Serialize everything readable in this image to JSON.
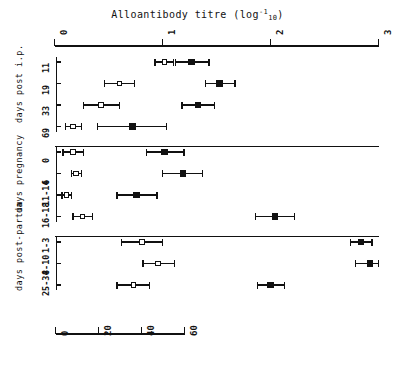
{
  "chart_data": {
    "type": "scatter",
    "title_parts": {
      "main": "Alloantibody titre (log",
      "sub": "10",
      "sup": "-1",
      "tail": ")"
    },
    "xlabel": "",
    "ylabel": "",
    "top_axis": {
      "label": "Alloantibody titre (log10^-1)",
      "ticks": [
        "0",
        "1",
        "2",
        "3"
      ],
      "values": [
        0,
        1,
        2,
        3
      ],
      "xlim": [
        0,
        3
      ],
      "position": "top"
    },
    "bottom_axis": {
      "ticks": [
        "0",
        "20",
        "40",
        "60"
      ],
      "values": [
        0,
        20,
        40,
        60
      ],
      "xlim": [
        0,
        60
      ],
      "position": "bottom"
    },
    "legend": {
      "position": "none",
      "entries": [
        {
          "name": "open-circle-series",
          "marker": "open circle"
        },
        {
          "name": "filled-square-series",
          "marker": "filled square"
        }
      ]
    },
    "grid": false,
    "groups": [
      {
        "name": "days post i.p.",
        "label_lines": [
          "days post",
          "i.p."
        ],
        "rows": [
          {
            "label": "11",
            "open": {
              "value": 1.02,
              "low": 0.93,
              "high": 1.1
            },
            "filled": {
              "value": 1.27,
              "low": 1.12,
              "high": 1.43
            }
          },
          {
            "label": "19",
            "open": {
              "value": 0.6,
              "low": 0.46,
              "high": 0.74
            },
            "filled": {
              "value": 1.53,
              "low": 1.4,
              "high": 1.67
            }
          },
          {
            "label": "33",
            "open": {
              "value": 0.43,
              "low": 0.27,
              "high": 0.6
            },
            "filled": {
              "value": 1.33,
              "low": 1.18,
              "high": 1.48
            }
          },
          {
            "label": "69",
            "open": {
              "value": 0.17,
              "low": 0.1,
              "high": 0.25
            },
            "filled": {
              "value": 0.72,
              "low": 0.4,
              "high": 1.04
            }
          }
        ]
      },
      {
        "name": "days pregnancy",
        "label_lines": [
          "days",
          "pregnancy"
        ],
        "rows": [
          {
            "label": "0",
            "open": {
              "value": 0.17,
              "low": 0.08,
              "high": 0.27
            },
            "filled": {
              "value": 1.02,
              "low": 0.85,
              "high": 1.2
            }
          },
          {
            "label": "6",
            "open": {
              "value": 0.2,
              "low": 0.16,
              "high": 0.25
            },
            "filled": {
              "value": 1.19,
              "low": 1.0,
              "high": 1.37
            }
          },
          {
            "label": "11-14",
            "open": {
              "value": 0.11,
              "low": 0.07,
              "high": 0.16
            },
            "filled": {
              "value": 0.76,
              "low": 0.58,
              "high": 0.95
            }
          },
          {
            "label": "16-18",
            "open": {
              "value": 0.26,
              "low": 0.17,
              "high": 0.35
            },
            "filled": {
              "value": 2.04,
              "low": 1.86,
              "high": 2.22
            }
          }
        ]
      },
      {
        "name": "days post-partum",
        "label_lines": [
          "days",
          "post-partum"
        ],
        "rows": [
          {
            "label": "1-3",
            "open": {
              "value": 0.81,
              "low": 0.62,
              "high": 1.0
            },
            "filled": {
              "value": 2.84,
              "low": 2.74,
              "high": 2.94
            }
          },
          {
            "label": "8-10",
            "open": {
              "value": 0.96,
              "low": 0.82,
              "high": 1.11
            },
            "filled": {
              "value": 2.92,
              "low": 2.79,
              "high": 3.0
            }
          },
          {
            "label": "25-34",
            "open": {
              "value": 0.73,
              "low": 0.58,
              "high": 0.88
            },
            "filled": {
              "value": 2.0,
              "low": 1.88,
              "high": 2.13
            }
          }
        ]
      }
    ]
  }
}
